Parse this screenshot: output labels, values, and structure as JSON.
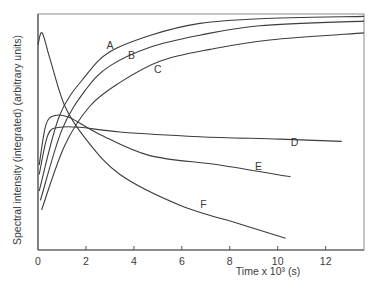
{
  "chart_data": {
    "type": "line",
    "title": "",
    "xlabel": "Time x 10³ (s)",
    "ylabel": "Spectral intensity (integrated) (arbitrary units)",
    "xlim": [
      0,
      13.6
    ],
    "ylim": [
      0,
      100
    ],
    "xticks": [
      0,
      2,
      4,
      6,
      8,
      10,
      12
    ],
    "yticks": [],
    "grid": false,
    "legend": "inline labels",
    "series": [
      {
        "name": "A",
        "label_pos": [
          3.0,
          85
        ],
        "x": [
          0.05,
          0.9,
          2.0,
          3.0,
          4.7,
          6.75,
          9.25,
          13.6
        ],
        "y": [
          25,
          57,
          74,
          84,
          91,
          96,
          98,
          99
        ]
      },
      {
        "name": "B",
        "label_pos": [
          3.9,
          81
        ],
        "x": [
          0.1,
          1.0,
          2.0,
          3.0,
          4.7,
          6.75,
          9.25,
          13.6
        ],
        "y": [
          21,
          51,
          68,
          78,
          86,
          91,
          95,
          97
        ]
      },
      {
        "name": "C",
        "label_pos": [
          5.0,
          75
        ],
        "x": [
          0.15,
          1.1,
          2.17,
          3.42,
          5.08,
          7.17,
          9.67,
          13.6
        ],
        "y": [
          17,
          44,
          61,
          71,
          80,
          85,
          89,
          92
        ]
      },
      {
        "name": "D",
        "label_pos": [
          10.7,
          44
        ],
        "x": [
          0.05,
          0.42,
          0.92,
          1.75,
          3.42,
          6.75,
          10.08,
          12.67
        ],
        "y": [
          32,
          49,
          52,
          52,
          50,
          48,
          47,
          46
        ]
      },
      {
        "name": "E",
        "label_pos": [
          9.2,
          34
        ],
        "x": [
          0.05,
          0.33,
          0.71,
          1.33,
          2.58,
          4.67,
          7.58,
          10.54
        ],
        "y": [
          36,
          53,
          57,
          56,
          49,
          40,
          36,
          31
        ]
      },
      {
        "name": "F",
        "label_pos": [
          6.9,
          18
        ],
        "x": [
          0.0,
          0.17,
          0.5,
          1.12,
          2.0,
          3.42,
          5.92,
          8.42,
          10.33
        ],
        "y": [
          87,
          92,
          81,
          61,
          47,
          32,
          19,
          11,
          5
        ]
      }
    ]
  }
}
